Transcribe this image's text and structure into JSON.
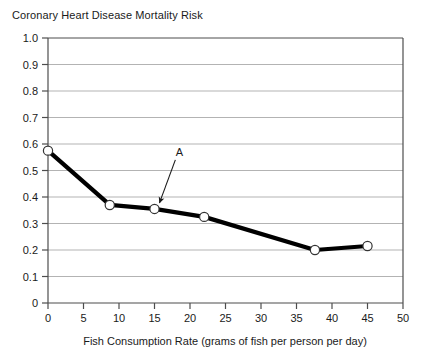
{
  "chart_data": {
    "type": "line",
    "title": "Coronary Heart Disease Mortality Risk",
    "xlabel": "Fish Consumption Rate (grams of fish per person per day)",
    "ylabel": "",
    "xlim": [
      0,
      50
    ],
    "ylim": [
      0,
      1.0
    ],
    "xticks": [
      "0",
      "5",
      "10",
      "15",
      "20",
      "25",
      "30",
      "35",
      "40",
      "45",
      "50"
    ],
    "xtick_values": [
      0,
      5,
      10,
      15,
      20,
      25,
      30,
      35,
      40,
      45,
      50
    ],
    "yticks": [
      "0",
      "0.1",
      "0.2",
      "0.3",
      "0.4",
      "0.5",
      "0.6",
      "0.7",
      "0.8",
      "0.9",
      "1.0"
    ],
    "ytick_values": [
      0,
      0.1,
      0.2,
      0.3,
      0.4,
      0.5,
      0.6,
      0.7,
      0.8,
      0.9,
      1.0
    ],
    "grid": "horizontal",
    "legend": "none",
    "series": [
      {
        "name": "Mortality risk",
        "marker": "open-circle",
        "line_color": "#000000",
        "x": [
          0,
          8.7,
          15,
          22,
          37.6,
          45
        ],
        "values": [
          0.575,
          0.37,
          0.355,
          0.325,
          0.2,
          0.215
        ]
      }
    ],
    "annotations": [
      {
        "label": "A",
        "points_to_x": 15,
        "points_to_y": 0.355,
        "label_x": 18.5,
        "label_y": 0.555
      }
    ]
  },
  "colors": {
    "background": "#ffffff",
    "axis": "#4d4d4d",
    "grid": "#b3b3b3",
    "line": "#000000",
    "marker_fill": "#ffffff",
    "marker_stroke": "#333333",
    "text": "#1a1a1a"
  }
}
